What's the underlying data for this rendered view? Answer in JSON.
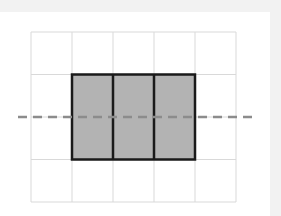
{
  "diagram": {
    "type": "grid-with-shaded-rectangle-and-dashed-line",
    "grid": {
      "columns": 5,
      "rows": 4,
      "origin_x": 31,
      "origin_y": 32,
      "cell_width": 41,
      "cell_height": 42.5,
      "line_color": "#d9d9d9"
    },
    "shaded_rectangle": {
      "col_start": 1,
      "col_end": 4,
      "row_start": 1,
      "row_end": 3,
      "cells_across": 3,
      "cells_down": 2,
      "fill_color": "#b3b3b3",
      "border_color": "#1a1a1a"
    },
    "dashed_line": {
      "orientation": "horizontal",
      "y": 117,
      "x_start": 18,
      "x_end": 256,
      "color": "#8c8c8c",
      "description": "line of symmetry through middle of shaded rectangle"
    },
    "colors": {
      "background": "#f2f2f2",
      "panel": "#ffffff"
    }
  }
}
